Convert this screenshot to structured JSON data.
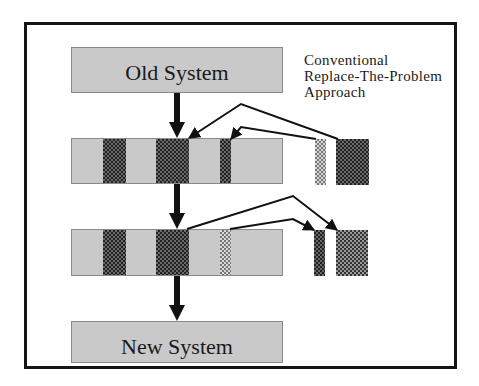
{
  "diagram": {
    "caption_lines": [
      "Conventional",
      "Replace-The-Problem",
      "Approach"
    ],
    "old_system_label": "Old System",
    "new_system_label": "New System",
    "stages": [
      {
        "name": "stage-1",
        "segments": [
          "dark",
          "dark",
          "dark"
        ],
        "extracted": [
          "light-thin",
          "dark-wide"
        ]
      },
      {
        "name": "stage-2",
        "segments": [
          "dark",
          "dark",
          "light"
        ],
        "extracted": [
          "dark-thin",
          "mid-wide"
        ]
      }
    ],
    "colors": {
      "frame": "#141414",
      "box_fill": "#c9c9c9",
      "arrow": "#111111"
    }
  }
}
